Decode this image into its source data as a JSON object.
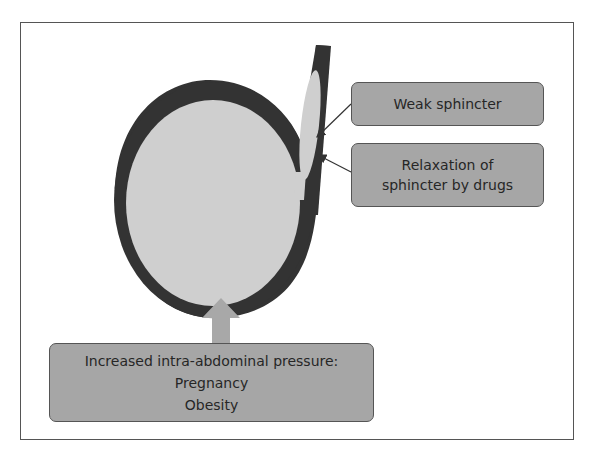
{
  "diagram": {
    "type": "anatomy-schematic",
    "colors": {
      "wall": "#333333",
      "lumen": "#cfcfcf",
      "label_box": "#a6a6a6",
      "pressure_arrow": "#a8a8a8",
      "frame": "#555555"
    },
    "labels": {
      "weak_sphincter": "Weak sphincter",
      "relaxation_line1": "Relaxation of",
      "relaxation_line2": "sphincter by drugs",
      "pressure_heading": "Increased intra-abdominal pressure:",
      "pressure_item1": "Pregnancy",
      "pressure_item2": "Obesity"
    }
  }
}
